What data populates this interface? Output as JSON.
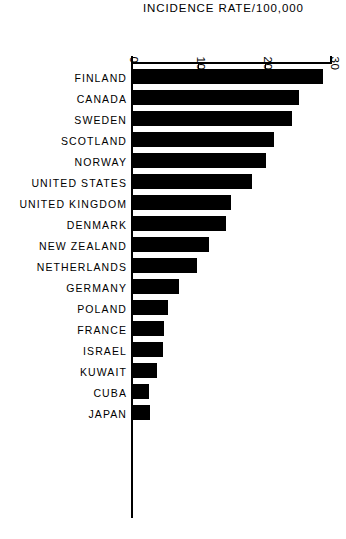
{
  "chart_data": {
    "type": "bar",
    "orientation": "horizontal",
    "title": "INCIDENCE RATE/100,000",
    "xlabel": "",
    "ylabel": "",
    "xlim": [
      0,
      30
    ],
    "xticks": [
      0,
      10,
      20,
      30
    ],
    "xtick_labels": [
      "0",
      "10",
      "20",
      "30"
    ],
    "grid": false,
    "legend": false,
    "categories": [
      "FINLAND",
      "CANADA",
      "SWEDEN",
      "SCOTLAND",
      "NORWAY",
      "UNITED STATES",
      "UNITED KINGDOM",
      "DENMARK",
      "NEW ZEALAND",
      "NETHERLANDS",
      "GERMANY",
      "POLAND",
      "FRANCE",
      "ISRAEL",
      "KUWAIT",
      "CUBA",
      "JAPAN"
    ],
    "values": [
      28.6,
      25.0,
      23.9,
      21.2,
      20.1,
      18.0,
      14.8,
      14.1,
      11.5,
      9.7,
      7.0,
      5.4,
      4.8,
      4.6,
      3.8,
      2.6,
      2.7
    ],
    "bar_color": "#000000",
    "background_color": "#ffffff"
  }
}
